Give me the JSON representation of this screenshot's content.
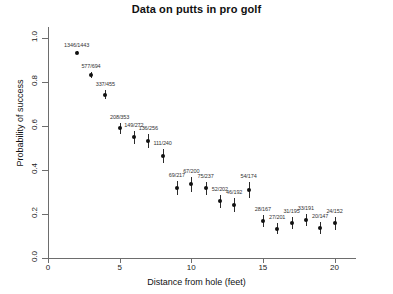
{
  "chart_data": {
    "type": "scatter",
    "title": "Data on putts in pro golf",
    "xlabel": "Distance from hole (feet)",
    "ylabel": "Probability of success",
    "xlim": [
      0,
      21.5
    ],
    "ylim": [
      0.0,
      1.05
    ],
    "grid": false,
    "legend": null,
    "error_bars": "binomial standard error",
    "xticks": [
      0,
      5,
      10,
      15,
      20
    ],
    "xtick_labels": [
      "0",
      "5",
      "10",
      "15",
      "20"
    ],
    "yticks": [
      0.0,
      0.2,
      0.4,
      0.6,
      0.8,
      1.0
    ],
    "ytick_labels": [
      "0.0",
      "0.2",
      "0.4",
      "0.6",
      "0.8",
      "1.0"
    ],
    "x": [
      2,
      3,
      4,
      5,
      6,
      7,
      8,
      9,
      10,
      11,
      12,
      13,
      14,
      15,
      16,
      17,
      18,
      19,
      20
    ],
    "values": [
      0.933,
      0.831,
      0.741,
      0.589,
      0.548,
      0.531,
      0.463,
      0.318,
      0.335,
      0.316,
      0.257,
      0.24,
      0.31,
      0.168,
      0.134,
      0.159,
      0.173,
      0.136,
      0.158
    ],
    "labels": [
      "1346/1443",
      "577/694",
      "337/455",
      "208/353",
      "149/272",
      "136/256",
      "111/240",
      "69/217",
      "67/200",
      "75/237",
      "52/202",
      "46/192",
      "54/174",
      "28/167",
      "27/201",
      "31/195",
      "33/191",
      "20/147",
      "24/152"
    ],
    "made": [
      1346,
      577,
      337,
      208,
      149,
      136,
      111,
      69,
      67,
      75,
      52,
      46,
      54,
      28,
      27,
      31,
      33,
      20,
      24
    ],
    "attempts": [
      1443,
      694,
      455,
      353,
      272,
      256,
      240,
      217,
      200,
      237,
      202,
      192,
      174,
      167,
      201,
      195,
      191,
      147,
      152
    ],
    "errors": [
      0.0066,
      0.0142,
      0.0205,
      0.0262,
      0.0302,
      0.0312,
      0.0322,
      0.0316,
      0.0334,
      0.0302,
      0.0307,
      0.0308,
      0.0351,
      0.029,
      0.024,
      0.0262,
      0.0274,
      0.0283,
      0.0296
    ],
    "colors": {
      "point": "#111111",
      "axis": "#6d6d6d",
      "label": "#333333",
      "background": "#ffffff"
    }
  }
}
